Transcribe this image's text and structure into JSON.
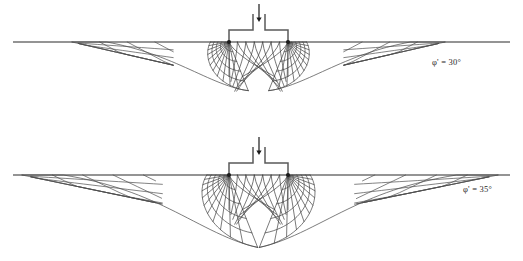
{
  "figure": {
    "kind": "bearing-capacity-slip-line-field",
    "background_color": "#ffffff",
    "line_color": "#454545",
    "ground_line_color": "#2b2b2b",
    "load_arrow_color": "#1a1a1a"
  },
  "panels": [
    {
      "id": "panel-top",
      "phi_label": "φ' = 30°",
      "phi_symbol": "φ'",
      "phi_value": "30°",
      "friction_angle_deg": 30,
      "label_x": 432,
      "label_y": 57,
      "ground_y": 42,
      "ground_x0": 13,
      "ground_x1": 510,
      "footing": {
        "left_edge_x": 229,
        "right_edge_x": 288,
        "base_y": 42,
        "shoulder_y": 30,
        "stem_left_x": 253,
        "stem_right_x": 265,
        "stem_top_y": 14
      },
      "load_arrow": {
        "x": 259,
        "y_top": 4,
        "y_bottom": 22
      },
      "fan": {
        "left_center_x": 229,
        "right_center_x": 288,
        "center_y": 42,
        "radius": 62,
        "n_radials": 11,
        "n_arcs": 5,
        "spiral_growth": 0.577
      },
      "outer_zone": {
        "left_toe_x": 72,
        "right_toe_x": 445,
        "mesh_rows": 4,
        "mesh_cols": 5,
        "wedge_angle_deg": 30
      },
      "max_depth_y": 106
    },
    {
      "id": "panel-bottom",
      "phi_label": "φ' = 35°",
      "phi_symbol": "φ'",
      "phi_value": "35°",
      "friction_angle_deg": 35,
      "label_x": 463,
      "label_y": 184,
      "ground_y": 175,
      "ground_x0": 13,
      "ground_x1": 510,
      "footing": {
        "left_edge_x": 229,
        "right_edge_x": 288,
        "base_y": 175,
        "shoulder_y": 163,
        "stem_left_x": 253,
        "stem_right_x": 265,
        "stem_top_y": 147
      },
      "load_arrow": {
        "x": 259,
        "y_top": 137,
        "y_bottom": 155
      },
      "fan": {
        "left_center_x": 229,
        "right_center_x": 288,
        "center_y": 175,
        "radius": 74,
        "n_radials": 11,
        "n_arcs": 5,
        "spiral_growth": 0.7
      },
      "outer_zone": {
        "left_toe_x": 22,
        "right_toe_x": 498,
        "mesh_rows": 4,
        "mesh_cols": 6,
        "wedge_angle_deg": 35
      },
      "max_depth_y": 248
    }
  ]
}
